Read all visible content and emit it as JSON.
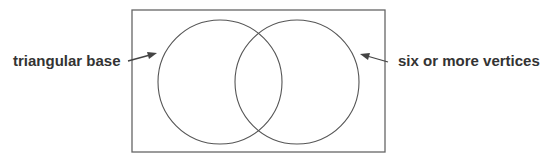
{
  "diagram": {
    "type": "venn",
    "colors": {
      "stroke": "#555555",
      "text": "#333333",
      "background": "#ffffff"
    },
    "left_label": "triangular base",
    "right_label": "six or more vertices"
  }
}
